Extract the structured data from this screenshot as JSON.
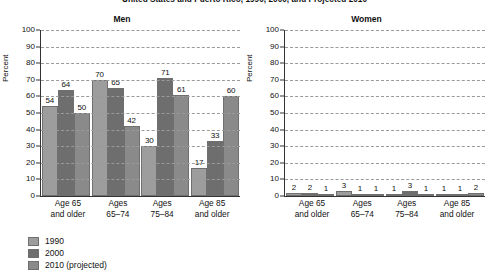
{
  "chart_data": {
    "type": "bar",
    "title": "United States and Puerto Rico, 1990, 2000, and Projected 2010",
    "ylabel": "Percent",
    "xlabel": "",
    "ylim": [
      0,
      100
    ],
    "yticks": [
      100,
      90,
      80,
      70,
      60,
      50,
      40,
      30,
      20,
      10,
      0
    ],
    "grid": true,
    "legend_position": "bottom-left",
    "categories": [
      "Age 65 and older",
      "Ages 65–74",
      "Ages 75–84",
      "Age 85 and older"
    ],
    "category_lines": [
      [
        "Age 65",
        "and older"
      ],
      [
        "Ages",
        "65–74"
      ],
      [
        "Ages",
        "75–84"
      ],
      [
        "Age 85",
        "and older"
      ]
    ],
    "legend": [
      {
        "name": "1990",
        "color": "#9d9d9d"
      },
      {
        "name": "2000",
        "color": "#6e6e6e"
      },
      {
        "name": "2010 (projected)",
        "color": "#8a8a8a"
      }
    ],
    "panels": [
      {
        "name": "Men",
        "series": [
          {
            "name": "1990",
            "values": [
              54,
              70,
              30,
              17
            ]
          },
          {
            "name": "2000",
            "values": [
              64,
              65,
              71,
              33
            ]
          },
          {
            "name": "2010 (projected)",
            "values": [
              50,
              42,
              61,
              60
            ]
          }
        ]
      },
      {
        "name": "Women",
        "series": [
          {
            "name": "1990",
            "values": [
              2,
              3,
              1,
              1
            ]
          },
          {
            "name": "2000",
            "values": [
              2,
              1,
              3,
              1
            ]
          },
          {
            "name": "2010 (projected)",
            "values": [
              1,
              1,
              1,
              2
            ]
          }
        ]
      }
    ]
  }
}
